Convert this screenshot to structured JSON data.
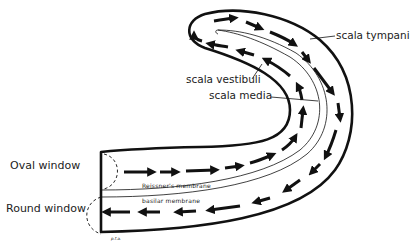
{
  "diagram": {
    "labels": {
      "oval_window": "Oval window",
      "round_window": "Round window",
      "scala_tympani": "scala tympani",
      "scala_vestibuli": "scala vestibuli",
      "scala_media": "scala media",
      "reissners_membrane": "Reissner's membrane",
      "basilar_membrane": "basilar membrane",
      "signature": "p.f.a."
    },
    "colors": {
      "ink": "#111111",
      "background": "#ffffff"
    },
    "flow": {
      "upper_channel": "arrows travel from oval window toward apex",
      "lower_channel": "arrows travel from apex back to round window"
    }
  }
}
